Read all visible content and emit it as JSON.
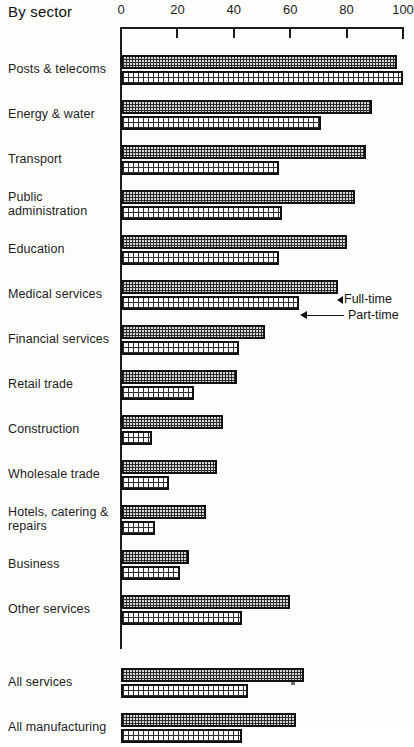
{
  "title": "By sector",
  "legend": {
    "full_time": "Full-time",
    "part_time": "Part-time"
  },
  "axis": {
    "ticks": [
      "0",
      "20",
      "40",
      "60",
      "80",
      "100"
    ],
    "min": 0,
    "max": 100
  },
  "chart_data": {
    "type": "bar",
    "orientation": "horizontal",
    "title": "By sector",
    "xlabel": "",
    "ylabel": "",
    "xlim": [
      0,
      100
    ],
    "grid": false,
    "legend_position": "inline-annotation",
    "categories": [
      "Posts & telecoms",
      "Energy & water",
      "Transport",
      "Public administration",
      "Education",
      "Medical services",
      "Financial services",
      "Retail trade",
      "Construction",
      "Wholesale trade",
      "Hotels, catering & repairs",
      "Business",
      "Other services"
    ],
    "summary_categories": [
      "All services",
      "All manufacturing"
    ],
    "series": [
      {
        "name": "Full-time",
        "values": [
          98,
          89,
          87,
          83,
          80,
          77,
          51,
          41,
          36,
          34,
          30,
          24,
          60
        ],
        "summary_values": [
          65,
          62
        ]
      },
      {
        "name": "Part-time",
        "values": [
          100,
          71,
          56,
          57,
          56,
          63,
          42,
          26,
          11,
          17,
          12,
          21,
          43
        ],
        "summary_values": [
          45,
          43
        ]
      }
    ]
  },
  "rows": [
    {
      "label": "Posts & telecoms",
      "full": 98,
      "part": 100
    },
    {
      "label": "Energy & water",
      "full": 89,
      "part": 71
    },
    {
      "label": "Transport",
      "full": 87,
      "part": 56
    },
    {
      "label": "Public administration",
      "full": 83,
      "part": 57
    },
    {
      "label": "Education",
      "full": 80,
      "part": 56
    },
    {
      "label": "Medical services",
      "full": 77,
      "part": 63
    },
    {
      "label": "Financial services",
      "full": 51,
      "part": 42
    },
    {
      "label": "Retail trade",
      "full": 41,
      "part": 26
    },
    {
      "label": "Construction",
      "full": 36,
      "part": 11
    },
    {
      "label": "Wholesale trade",
      "full": 34,
      "part": 17
    },
    {
      "label": "Hotels, catering & repairs",
      "full": 30,
      "part": 12
    },
    {
      "label": "Business",
      "full": 24,
      "part": 21
    },
    {
      "label": "Other services",
      "full": 60,
      "part": 43
    }
  ],
  "summary_rows": [
    {
      "label": "All services",
      "full": 65,
      "part": 45
    },
    {
      "label": "All manufacturing",
      "full": 62,
      "part": 43
    }
  ]
}
